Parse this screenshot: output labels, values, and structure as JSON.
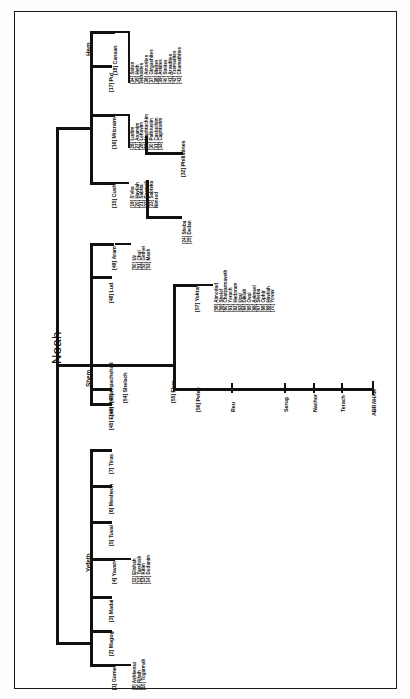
{
  "document": {
    "title": "Noah",
    "type": "genealogy-chart",
    "orientation": "rotated-90"
  },
  "root": {
    "label": "Noah"
  },
  "branches": [
    {
      "id": "japheth",
      "label": "Yefeth",
      "children": [
        {
          "num": "[1]",
          "label": "Gomer",
          "children": [
            {
              "num": "[8]",
              "label": "Ashkenaz"
            },
            {
              "num": "[9]",
              "label": "Rifath"
            },
            {
              "num": "[10]",
              "label": "Togarmah"
            }
          ]
        },
        {
          "num": "[2]",
          "label": "Magog"
        },
        {
          "num": "[3]",
          "label": "Madai"
        },
        {
          "num": "[4]",
          "label": "Yavan",
          "children": [
            {
              "num": "[11]",
              "label": "Elishah"
            },
            {
              "num": "[12]",
              "label": "Tarshish"
            },
            {
              "num": "[13]",
              "label": "Kitim"
            },
            {
              "num": "[14]",
              "label": "Dodanim"
            }
          ]
        },
        {
          "num": "[5]",
          "label": "Tuval"
        },
        {
          "num": "[6]",
          "label": "Meshech"
        },
        {
          "num": "[7]",
          "label": "Tiras"
        }
      ]
    },
    {
      "id": "shem",
      "label": "Shem",
      "children": [
        {
          "num": "[45]",
          "label": "Elam"
        },
        {
          "num": "[46]",
          "label": "Ashur"
        },
        {
          "num": "[47]",
          "label": "Arpachshad",
          "children": [
            {
              "num": "[54]",
              "label": "Shelach",
              "children": [
                {
                  "num": "[55]",
                  "label": "Eber",
                  "children": [
                    {
                      "num": "[57]",
                      "label": "Yoktan",
                      "children": [
                        {
                          "num": "[58]",
                          "label": "Almodad"
                        },
                        {
                          "num": "[59]",
                          "label": "Shelef"
                        },
                        {
                          "num": "[60]",
                          "label": "Chatzarmaveth"
                        },
                        {
                          "num": "[61]",
                          "label": "Yerach"
                        },
                        {
                          "num": "[62]",
                          "label": "Hadoram"
                        },
                        {
                          "num": "[63]",
                          "label": "Uzal"
                        },
                        {
                          "num": "[64]",
                          "label": "Diklah"
                        },
                        {
                          "num": "[65]",
                          "label": "Oval"
                        },
                        {
                          "num": "[66]",
                          "label": "Avimael"
                        },
                        {
                          "num": "[67]",
                          "label": "Sheba"
                        },
                        {
                          "num": "[68]",
                          "label": "Ophir"
                        },
                        {
                          "num": "[69]",
                          "label": "Havilah"
                        },
                        {
                          "num": "[70]",
                          "label": "Yovav"
                        }
                      ]
                    },
                    {
                      "num": "[56]",
                      "label": "Peleg",
                      "line": [
                        {
                          "label": "Reu"
                        },
                        {
                          "label": "Serug"
                        },
                        {
                          "label": "Nachor"
                        },
                        {
                          "label": "Terach"
                        },
                        {
                          "label": "ABRAHAM"
                        }
                      ]
                    }
                  ]
                }
              ]
            }
          ]
        },
        {
          "num": "[48]",
          "label": "Lud"
        },
        {
          "num": "[49]",
          "label": "Aram",
          "children": [
            {
              "num": "[50]",
              "label": "Uz"
            },
            {
              "num": "[51]",
              "label": "Chul"
            },
            {
              "num": "[52]",
              "label": "Gether"
            },
            {
              "num": "[53]",
              "label": "Mash"
            }
          ]
        }
      ]
    },
    {
      "id": "ham",
      "label": "Ham",
      "children": [
        {
          "num": "[15]",
          "label": "Cush",
          "children": [
            {
              "num": "[19]",
              "label": "S'vha"
            },
            {
              "num": "[20]",
              "label": "Havilah"
            },
            {
              "num": "[21]",
              "label": "Sabtta"
            },
            {
              "num": "[22]",
              "label": "Raamah",
              "children": [
                {
                  "num": "[24]",
                  "label": "Sheba"
                },
                {
                  "num": "[25]",
                  "label": "Dedan"
                }
              ]
            },
            {
              "num": "[23]",
              "label": "Sabteka"
            },
            {
              "num": "",
              "label": "Nimrod"
            }
          ]
        },
        {
          "num": "[16]",
          "label": "Mitzraim",
          "children": [
            {
              "num": "[26]",
              "label": "Ludim"
            },
            {
              "num": "[27]",
              "label": "Anamim"
            },
            {
              "num": "[28]",
              "label": "Lehavim"
            },
            {
              "num": "[29]",
              "label": "Naphtuchim"
            },
            {
              "num": "[30]",
              "label": "Pathrusim"
            },
            {
              "num": "[31]",
              "label": "Casluchim"
            },
            {
              "num": "[33]",
              "label": "Caphtorim"
            },
            {
              "num": "[32]",
              "label": "Philistines"
            }
          ]
        },
        {
          "num": "[17]",
          "label": "Put"
        },
        {
          "num": "[18]",
          "label": "Canaan",
          "children": [
            {
              "num": "[34]",
              "label": "Sidon"
            },
            {
              "num": "[35]",
              "label": "Heth"
            },
            {
              "num": "",
              "label": "Jebusites"
            },
            {
              "num": "[36]",
              "label": "Amorites"
            },
            {
              "num": "[37]",
              "label": "Girgashites"
            },
            {
              "num": "[38]",
              "label": "Hivites"
            },
            {
              "num": "[39]",
              "label": "Arkites"
            },
            {
              "num": "[40]",
              "label": "Sinites"
            },
            {
              "num": "[41]",
              "label": "Arvadites"
            },
            {
              "num": "[42]",
              "label": "Tzemarites"
            },
            {
              "num": "[43]",
              "label": "Chamathites"
            },
            {
              "num": "[44]",
              "label": ""
            }
          ]
        }
      ]
    }
  ]
}
